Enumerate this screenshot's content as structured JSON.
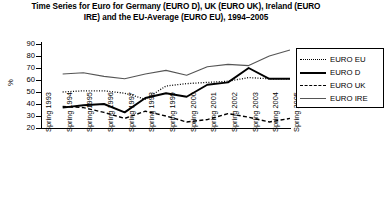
{
  "chart_data": {
    "type": "line",
    "title": "Time Series for Euro for Germany (EURO D), UK (EURO UK), Ireland (EURO IRE) and the EU-Average (EURO EU), 1994–2005",
    "xlabel": "",
    "ylabel": "%",
    "ylim": [
      20,
      90
    ],
    "yticks": [
      20,
      30,
      40,
      50,
      60,
      70,
      80,
      90
    ],
    "grid": false,
    "legend_position": "right",
    "categories": [
      "Spring 1993",
      "Spring 1994",
      "Spring 1995",
      "Spring 1996",
      "Spring 1997",
      "Spring 1998",
      "Spring 1999",
      "Spring 2000",
      "Spring 2001",
      "Spring 2002",
      "Spring 2003",
      "Spring 2004",
      "Spring 2005"
    ],
    "series": [
      {
        "name": "EURO EU",
        "style": "dotted",
        "values": [
          null,
          50,
          51,
          51,
          49,
          44,
          55,
          57,
          58,
          59,
          62,
          61,
          61
        ]
      },
      {
        "name": "EURO D",
        "style": "solid-thick",
        "values": [
          null,
          37,
          39,
          40,
          33,
          45,
          49,
          46,
          56,
          58,
          70,
          61,
          61
        ]
      },
      {
        "name": "EURO UK",
        "style": "dashed",
        "values": [
          null,
          38,
          37,
          33,
          28,
          34,
          30,
          25,
          27,
          32,
          29,
          25,
          28
        ]
      },
      {
        "name": "EURO IRE",
        "style": "solid-thin",
        "values": [
          null,
          65,
          66,
          63,
          61,
          65,
          68,
          64,
          71,
          73,
          72,
          80,
          85
        ]
      }
    ]
  },
  "legend": {
    "entries": [
      {
        "label": "EURO EU"
      },
      {
        "label": "EURO D"
      },
      {
        "label": "EURO UK"
      },
      {
        "label": "EURO IRE"
      }
    ]
  },
  "colors": {
    "axis": "#000000",
    "euro_eu": "#000000",
    "euro_d": "#000000",
    "euro_uk": "#000000",
    "euro_ire": "#555555",
    "background": "#ffffff"
  }
}
